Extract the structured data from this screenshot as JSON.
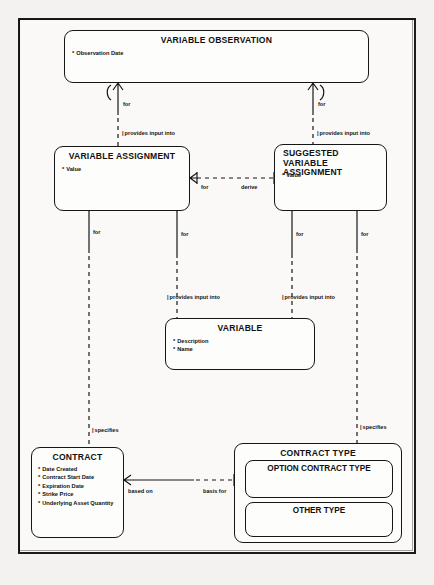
{
  "diagram": {
    "notation": "Barker crow's foot ERD",
    "stroke_color": "#161616",
    "paper_color": "#f3f2f0"
  },
  "entities": [
    {
      "id": "variable-observation",
      "name": "VARIABLE OBSERVATION",
      "attributes": [
        {
          "marker": "*",
          "label": "Observation Date"
        }
      ]
    },
    {
      "id": "variable-assignment",
      "name": "VARIABLE ASSIGNMENT",
      "attributes": [
        {
          "marker": "*",
          "label": "Value"
        }
      ]
    },
    {
      "id": "suggested-variable-assignment",
      "name": "SUGGESTED VARIABLE ASSIGNMENT",
      "name_line1": "SUGGESTED VARIABLE",
      "name_line2": "ASSIGNMENT",
      "attributes": [
        {
          "marker": "*",
          "label": "Value"
        }
      ]
    },
    {
      "id": "variable",
      "name": "VARIABLE",
      "attributes": [
        {
          "marker": "*",
          "label": "Description"
        },
        {
          "marker": "*",
          "label": "Name"
        }
      ]
    },
    {
      "id": "contract",
      "name": "CONTRACT",
      "attributes": [
        {
          "marker": "*",
          "label": "Date Created"
        },
        {
          "marker": "*",
          "label": "Contract Start Date"
        },
        {
          "marker": "*",
          "label": "Expiration Date"
        },
        {
          "marker": "*",
          "label": "Strike Price"
        },
        {
          "marker": "*",
          "label": "Underlying Asset Quantity"
        }
      ]
    },
    {
      "id": "contract-type",
      "name": "CONTRACT TYPE",
      "attributes": [],
      "subtypes": [
        {
          "id": "option-contract-type",
          "name": "OPTION CONTRACT TYPE"
        },
        {
          "id": "other-type",
          "name": "OTHER TYPE"
        }
      ]
    }
  ],
  "relationships": [
    {
      "id": "vo-va-for",
      "label": "for"
    },
    {
      "id": "vo-va-provides",
      "label": "provides input into"
    },
    {
      "id": "vo-sva-for",
      "label": "for"
    },
    {
      "id": "vo-sva-provides",
      "label": "provides input into"
    },
    {
      "id": "va-sva-for",
      "label": "for"
    },
    {
      "id": "va-sva-derive",
      "label": "derive"
    },
    {
      "id": "va-contract-for",
      "label": "for"
    },
    {
      "id": "va-variable-for",
      "label": "for"
    },
    {
      "id": "va-variable-provides",
      "label": "provides input into"
    },
    {
      "id": "sva-variable-for",
      "label": "for"
    },
    {
      "id": "sva-variable-provides",
      "label": "provides input into"
    },
    {
      "id": "sva-ctype-for",
      "label": "for"
    },
    {
      "id": "contract-specifies",
      "label": "specifies"
    },
    {
      "id": "ctype-specifies",
      "label": "specifies"
    },
    {
      "id": "contract-based-on",
      "label": "based on"
    },
    {
      "id": "ctype-basis-for",
      "label": "basis for"
    }
  ]
}
